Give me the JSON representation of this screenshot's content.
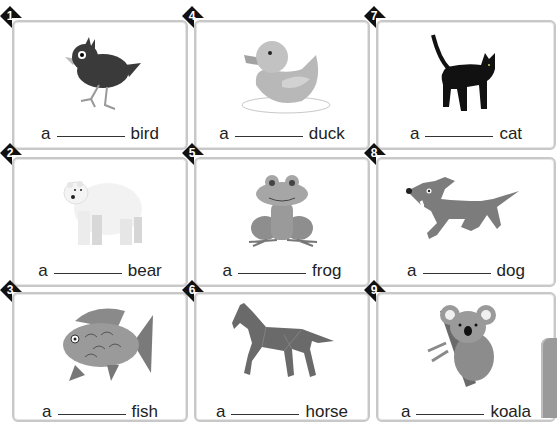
{
  "worksheet": {
    "article": "a",
    "cards": [
      {
        "number": "1",
        "animal": "bird",
        "icon": "bird-icon",
        "col": 0,
        "row": 0
      },
      {
        "number": "2",
        "animal": "bear",
        "icon": "bear-icon",
        "col": 0,
        "row": 1
      },
      {
        "number": "3",
        "animal": "fish",
        "icon": "fish-icon",
        "col": 0,
        "row": 2
      },
      {
        "number": "4",
        "animal": "duck",
        "icon": "duck-icon",
        "col": 1,
        "row": 0
      },
      {
        "number": "5",
        "animal": "frog",
        "icon": "frog-icon",
        "col": 1,
        "row": 1
      },
      {
        "number": "6",
        "animal": "horse",
        "icon": "horse-icon",
        "col": 1,
        "row": 2
      },
      {
        "number": "7",
        "animal": "cat",
        "icon": "cat-icon",
        "col": 2,
        "row": 0
      },
      {
        "number": "8",
        "animal": "dog",
        "icon": "dog-icon",
        "col": 2,
        "row": 1
      },
      {
        "number": "9",
        "animal": "koala",
        "icon": "koala-icon",
        "col": 2,
        "row": 2
      }
    ]
  },
  "colors": {
    "badge": "#111111",
    "card_border": "#c8c8c8",
    "text": "#222222",
    "side_tab": "#9a9a9a"
  }
}
